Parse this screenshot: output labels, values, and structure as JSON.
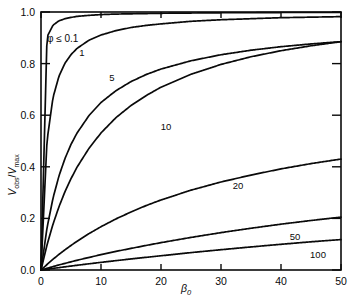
{
  "figure": {
    "background_color": "#ffffff",
    "line_color": "#0a0a0a",
    "axis_color": "#0a0a0a"
  },
  "axes": {
    "x_title": "β",
    "x_title_sub": "0",
    "y_title_num": "V",
    "y_title_num_sub": "obs",
    "y_title_slash": "/",
    "y_title_den": "V",
    "y_title_den_sub": "max",
    "x_ticks": [
      "0",
      "10",
      "20",
      "30",
      "40",
      "50"
    ],
    "x_tick_values": [
      0,
      10,
      20,
      30,
      40,
      50
    ],
    "y_ticks": [
      "0.0",
      "0.2",
      "0.4",
      "0.6",
      "0.8",
      "1.0"
    ],
    "y_tick_values": [
      0.0,
      0.2,
      0.4,
      0.6,
      0.8,
      1.0
    ]
  },
  "annotation": {
    "text": "φ ≤ 0.1"
  },
  "curve_labels": [
    {
      "text": "1",
      "x": 82,
      "y": 56
    },
    {
      "text": "5",
      "x": 112,
      "y": 81
    },
    {
      "text": "10",
      "x": 166,
      "y": 130
    },
    {
      "text": "20",
      "x": 238,
      "y": 189
    },
    {
      "text": "50",
      "x": 295,
      "y": 240
    },
    {
      "text": "100",
      "x": 318,
      "y": 258
    }
  ],
  "caption": {
    "cropped_text": ""
  },
  "chart_data": {
    "type": "line",
    "title": "",
    "subtitle": "",
    "xlabel": "β₀",
    "ylabel": "V_obs / V_max",
    "xlim": [
      0,
      50
    ],
    "ylim": [
      0,
      1.0
    ],
    "grid": false,
    "legend": "inline-curve-labels",
    "annotations": [
      "φ ≤ 0.1"
    ],
    "x": [
      0,
      1,
      2,
      3,
      4,
      5,
      6,
      8,
      10,
      12.5,
      15,
      17.5,
      20,
      25,
      30,
      35,
      40,
      45,
      50
    ],
    "series": [
      {
        "name": "φ ≤ 0.1",
        "label": "0.1",
        "values": [
          0.0,
          0.902,
          0.948,
          0.965,
          0.973,
          0.978,
          0.982,
          0.986,
          0.989,
          0.991,
          0.992,
          0.993,
          0.994,
          0.995,
          0.996,
          0.996,
          0.997,
          0.997,
          0.997
        ]
      },
      {
        "name": "1",
        "label": "1",
        "values": [
          0.0,
          0.5,
          0.667,
          0.75,
          0.8,
          0.833,
          0.857,
          0.889,
          0.909,
          0.926,
          0.938,
          0.946,
          0.952,
          0.962,
          0.968,
          0.972,
          0.976,
          0.978,
          0.98
        ]
      },
      {
        "name": "5",
        "label": "5",
        "values": [
          0.0,
          0.167,
          0.286,
          0.375,
          0.444,
          0.5,
          0.545,
          0.615,
          0.667,
          0.714,
          0.75,
          0.778,
          0.8,
          0.833,
          0.857,
          0.875,
          0.889,
          0.9,
          0.909
        ]
      },
      {
        "name": "10",
        "label": "10",
        "values": [
          0.0,
          0.091,
          0.167,
          0.231,
          0.286,
          0.333,
          0.375,
          0.444,
          0.5,
          0.556,
          0.6,
          0.636,
          0.667,
          0.714,
          0.75,
          0.778,
          0.8,
          0.818,
          0.833
        ]
      },
      {
        "name": "20",
        "label": "20",
        "values": [
          0.0,
          0.03,
          0.059,
          0.086,
          0.111,
          0.135,
          0.158,
          0.2,
          0.238,
          0.281,
          0.319,
          0.354,
          0.385,
          0.439,
          0.484,
          0.522,
          0.556,
          0.585,
          0.61
        ]
      },
      {
        "name": "50",
        "label": "50",
        "values": [
          0.0,
          0.012,
          0.024,
          0.036,
          0.047,
          0.058,
          0.069,
          0.089,
          0.109,
          0.132,
          0.153,
          0.174,
          0.194,
          0.231,
          0.265,
          0.296,
          0.325,
          0.351,
          0.375
        ]
      },
      {
        "name": "100",
        "label": "100",
        "values": [
          0.0,
          0.006,
          0.012,
          0.018,
          0.024,
          0.03,
          0.036,
          0.047,
          0.058,
          0.071,
          0.084,
          0.096,
          0.108,
          0.132,
          0.154,
          0.175,
          0.195,
          0.214,
          0.231
        ]
      }
    ]
  }
}
